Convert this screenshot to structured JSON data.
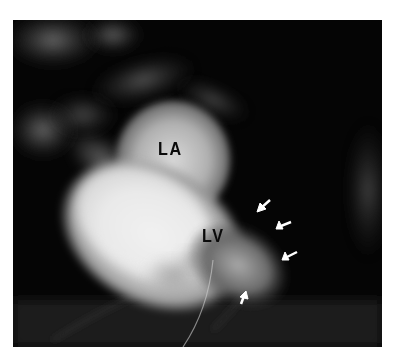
{
  "figure": {
    "type": "X-ray angiogram (left ventriculogram)",
    "labels": {
      "left_atrium": "LA",
      "left_ventricle": "LV"
    },
    "arrows": [
      {
        "direction": "down-left",
        "tip": [
          258,
          211
        ]
      },
      {
        "direction": "down-left",
        "tip": [
          277,
          228
        ]
      },
      {
        "direction": "down-left",
        "tip": [
          283,
          259
        ]
      },
      {
        "direction": "up-right",
        "tip": [
          245,
          293
        ]
      }
    ],
    "colors": {
      "background": "#050505",
      "contrast_opacity": "#f2f2f2",
      "label_text": "#0a0a0a",
      "arrow": "#ffffff"
    }
  }
}
